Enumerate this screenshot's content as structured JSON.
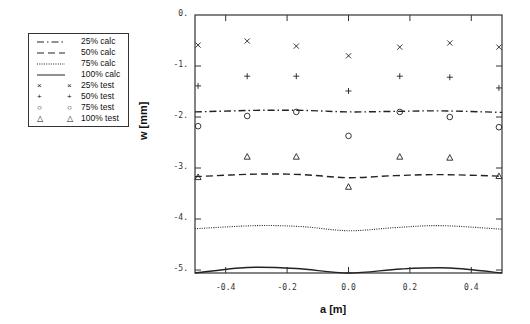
{
  "chart_data": {
    "type": "line",
    "title": "",
    "xlabel": "a [m]",
    "ylabel": "w [mm]",
    "xlim": [
      -0.5,
      0.5
    ],
    "ylim": [
      -5.06,
      0
    ],
    "grid": false,
    "legend_position": "outside-left",
    "x_ticks": [
      "-0.4",
      "-0.2",
      "0.0",
      "0.2",
      "0.4"
    ],
    "y_ticks": [
      "0.",
      "-1.",
      "-2.",
      "-3.",
      "-4.",
      "-5."
    ],
    "legend": [
      {
        "label": "25% calc",
        "style": "dash-dot"
      },
      {
        "label": "50% calc",
        "style": "dashed"
      },
      {
        "label": "75% calc",
        "style": "dotted"
      },
      {
        "label": "100% calc",
        "style": "solid"
      },
      {
        "label": "25% test",
        "marker": "×"
      },
      {
        "label": "50% test",
        "marker": "+"
      },
      {
        "label": "75% test",
        "marker": "○"
      },
      {
        "label": "100% test",
        "marker": "△"
      }
    ],
    "x": [
      -0.49,
      -0.33,
      -0.17,
      0.0,
      0.167,
      0.33,
      0.49
    ],
    "series": [
      {
        "name": "25% test",
        "marker": "×",
        "values": [
          -0.59,
          -0.51,
          -0.61,
          -0.8,
          -0.63,
          -0.55,
          -0.63
        ]
      },
      {
        "name": "50% test",
        "marker": "+",
        "values": [
          -1.39,
          -1.2,
          -1.2,
          -1.49,
          -1.2,
          -1.22,
          -1.43
        ]
      },
      {
        "name": "75% test",
        "marker": "○",
        "values": [
          -2.18,
          -1.98,
          -1.9,
          -2.37,
          -1.9,
          -2.0,
          -2.2
        ]
      },
      {
        "name": "100% test",
        "marker": "△",
        "values": [
          -3.18,
          -2.78,
          -2.78,
          -3.37,
          -2.78,
          -2.8,
          -3.16
        ]
      }
    ],
    "curves": [
      {
        "name": "25% calc",
        "style": "dash-dot",
        "x": [
          -0.5,
          -0.3,
          -0.15,
          0.0,
          0.15,
          0.3,
          0.5
        ],
        "y": [
          -1.9,
          -1.87,
          -1.87,
          -1.9,
          -1.89,
          -1.88,
          -1.91
        ]
      },
      {
        "name": "50% calc",
        "style": "dashed",
        "x": [
          -0.5,
          -0.3,
          -0.15,
          0.0,
          0.15,
          0.3,
          0.5
        ],
        "y": [
          -3.17,
          -3.12,
          -3.13,
          -3.19,
          -3.15,
          -3.13,
          -3.16
        ]
      },
      {
        "name": "75% calc",
        "style": "dotted",
        "x": [
          -0.5,
          -0.3,
          -0.15,
          0.0,
          0.15,
          0.3,
          0.5
        ],
        "y": [
          -4.19,
          -4.13,
          -4.15,
          -4.23,
          -4.17,
          -4.13,
          -4.2
        ]
      },
      {
        "name": "100% calc",
        "style": "solid",
        "x": [
          -0.5,
          -0.33,
          -0.17,
          0.0,
          0.17,
          0.33,
          0.5
        ],
        "y": [
          -5.06,
          -4.95,
          -4.97,
          -5.07,
          -4.98,
          -4.96,
          -5.06
        ]
      }
    ]
  }
}
